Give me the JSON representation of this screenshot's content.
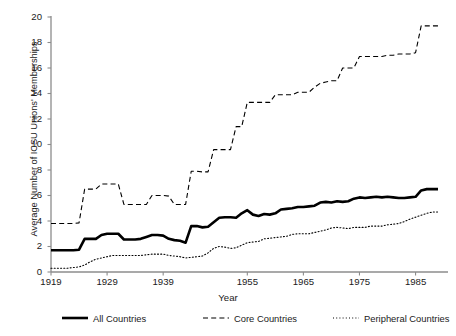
{
  "chart_data": {
    "type": "line",
    "title": "",
    "xlabel": "Year",
    "ylabel": "Average Number of ICSU Unions' Memberships",
    "ylim": [
      0,
      20
    ],
    "yticks": [
      0,
      2,
      4,
      6,
      8,
      10,
      12,
      14,
      16,
      18,
      20
    ],
    "xticks": [
      1919,
      1929,
      1939,
      1955,
      1965,
      1975,
      1985
    ],
    "xlim": [
      1919,
      1990
    ],
    "grid": false,
    "legend_position": "below-axes",
    "x": [
      1919,
      1920,
      1921,
      1922,
      1923,
      1924,
      1925,
      1926,
      1927,
      1928,
      1929,
      1930,
      1931,
      1932,
      1933,
      1934,
      1935,
      1936,
      1937,
      1938,
      1939,
      1940,
      1941,
      1942,
      1943,
      1944,
      1946,
      1947,
      1948,
      1949,
      1950,
      1951,
      1952,
      1953,
      1954,
      1955,
      1956,
      1957,
      1958,
      1959,
      1960,
      1961,
      1962,
      1963,
      1964,
      1965,
      1966,
      1967,
      1968,
      1969,
      1970,
      1971,
      1972,
      1973,
      1974,
      1975,
      1976,
      1977,
      1978,
      1979,
      1980,
      1981,
      1982,
      1983,
      1984,
      1985,
      1986,
      1987,
      1988,
      1989
    ],
    "series": [
      {
        "name": "All Countries",
        "style": "solid",
        "width": 2.6,
        "values": [
          1.7,
          1.7,
          1.7,
          1.7,
          1.7,
          1.75,
          2.6,
          2.6,
          2.6,
          2.9,
          3.0,
          3.0,
          3.0,
          2.55,
          2.55,
          2.55,
          2.6,
          2.75,
          2.9,
          2.9,
          2.85,
          2.6,
          2.5,
          2.45,
          2.3,
          3.6,
          3.6,
          3.5,
          3.55,
          3.9,
          4.25,
          4.3,
          4.3,
          4.25,
          4.6,
          4.85,
          4.5,
          4.4,
          4.55,
          4.5,
          4.6,
          4.9,
          4.95,
          5.0,
          5.1,
          5.1,
          5.15,
          5.2,
          5.45,
          5.5,
          5.45,
          5.55,
          5.5,
          5.55,
          5.75,
          5.85,
          5.8,
          5.85,
          5.9,
          5.85,
          5.9,
          5.85,
          5.8,
          5.8,
          5.85,
          5.9,
          6.4,
          6.5,
          6.5,
          6.5
        ]
      },
      {
        "name": "Core Countries",
        "style": "dashed",
        "width": 1.1,
        "values": [
          3.8,
          3.8,
          3.8,
          3.8,
          3.8,
          3.85,
          6.5,
          6.5,
          6.5,
          6.9,
          6.9,
          6.9,
          6.9,
          5.3,
          5.3,
          5.3,
          5.3,
          5.3,
          6.0,
          6.0,
          6.0,
          5.95,
          5.3,
          5.3,
          5.3,
          7.9,
          7.9,
          7.85,
          7.85,
          9.6,
          9.6,
          9.6,
          9.6,
          11.4,
          11.4,
          13.3,
          13.3,
          13.3,
          13.3,
          13.3,
          13.9,
          13.9,
          13.9,
          13.9,
          14.1,
          14.1,
          14.1,
          14.5,
          14.8,
          14.9,
          15.0,
          15.0,
          16.0,
          16.0,
          16.0,
          16.9,
          16.9,
          16.9,
          16.9,
          16.9,
          17.0,
          17.0,
          17.1,
          17.1,
          17.1,
          17.2,
          19.3,
          19.3,
          19.3,
          19.3
        ]
      },
      {
        "name": "Peripheral Countries",
        "style": "dotted",
        "width": 1.1,
        "values": [
          0.3,
          0.3,
          0.3,
          0.3,
          0.35,
          0.4,
          0.55,
          0.8,
          1.0,
          1.1,
          1.2,
          1.3,
          1.3,
          1.3,
          1.3,
          1.3,
          1.3,
          1.35,
          1.4,
          1.4,
          1.4,
          1.3,
          1.25,
          1.2,
          1.1,
          1.15,
          1.2,
          1.25,
          1.5,
          1.85,
          2.0,
          1.95,
          1.85,
          1.9,
          2.1,
          2.3,
          2.35,
          2.4,
          2.6,
          2.65,
          2.7,
          2.75,
          2.8,
          2.95,
          3.0,
          3.0,
          3.0,
          3.1,
          3.2,
          3.3,
          3.45,
          3.5,
          3.45,
          3.4,
          3.5,
          3.5,
          3.5,
          3.6,
          3.6,
          3.6,
          3.7,
          3.75,
          3.8,
          3.95,
          4.15,
          4.3,
          4.45,
          4.6,
          4.7,
          4.7
        ]
      }
    ]
  },
  "axis": {
    "y_title": "Average Number of ICSU Unions' Memberships",
    "x_title": "Year",
    "y_tick_labels": [
      "20",
      "18",
      "16",
      "14",
      "12",
      "10",
      "8",
      "6",
      "4",
      "2",
      "0"
    ],
    "x_tick_labels": [
      "1919",
      "1929",
      "1939",
      "1955",
      "1965",
      "1975",
      "1985"
    ]
  },
  "legend": {
    "items": [
      {
        "label": "All Countries",
        "style": "solid"
      },
      {
        "label": "Core Countries",
        "style": "dashed"
      },
      {
        "label": "Peripheral Countries",
        "style": "dotted"
      }
    ]
  },
  "colors": {
    "line": "#000000",
    "axis": "#8c8c8c",
    "text": "#1a1a1a",
    "background": "#ffffff"
  }
}
